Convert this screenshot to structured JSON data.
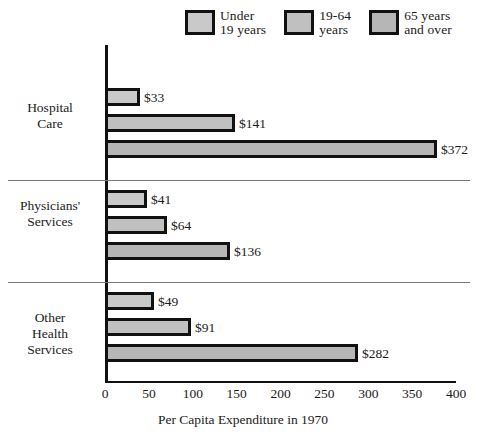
{
  "chart_data": {
    "type": "bar",
    "orientation": "horizontal",
    "title": "",
    "xlabel": "Per Capita Expenditure in 1970",
    "ylabel": "",
    "xlim": [
      0,
      400
    ],
    "xticks": [
      0,
      50,
      100,
      150,
      200,
      250,
      300,
      350,
      400
    ],
    "grid": false,
    "legend_position": "top",
    "categories": [
      "Hospital\nCare",
      "Physicians'\nServices",
      "Other\nHealth\nServices"
    ],
    "series": [
      {
        "name": "Under\n19 years",
        "color": "#c9c9c9",
        "values": [
          33,
          141,
          372
        ],
        "labels": [
          "$33",
          "$141",
          "$372"
        ]
      },
      {
        "name": "19-64\nyears",
        "color": "#c0c0c0",
        "values": [
          41,
          64,
          136
        ],
        "labels": [
          "$41",
          "$64",
          "$136"
        ]
      },
      {
        "name": "65 years\nand over",
        "color": "#b6b6b6",
        "values": [
          49,
          91,
          282
        ],
        "labels": [
          "$49",
          "$91",
          "$282"
        ]
      }
    ],
    "groups": [
      {
        "category": "Hospital\nCare",
        "bars": [
          {
            "series": "Under 19 years",
            "value": 33,
            "label": "$33"
          },
          {
            "series": "19-64 years",
            "value": 141,
            "label": "$141"
          },
          {
            "series": "65 years and over",
            "value": 372,
            "label": "$372"
          }
        ]
      },
      {
        "category": "Physicians'\nServices",
        "bars": [
          {
            "series": "Under 19 years",
            "value": 41,
            "label": "$41"
          },
          {
            "series": "19-64 years",
            "value": 64,
            "label": "$64"
          },
          {
            "series": "65 years and over",
            "value": 136,
            "label": "$136"
          }
        ]
      },
      {
        "category": "Other\nHealth\nServices",
        "bars": [
          {
            "series": "Under 19 years",
            "value": 49,
            "label": "$49"
          },
          {
            "series": "19-64 years",
            "value": 91,
            "label": "$91"
          },
          {
            "series": "65 years and over",
            "value": 282,
            "label": "$282"
          }
        ]
      }
    ]
  },
  "colors": {
    "ink": "#111111",
    "separator": "#777777",
    "background": "#ffffff"
  }
}
